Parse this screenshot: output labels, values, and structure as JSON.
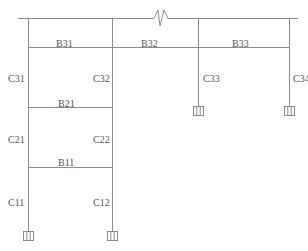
{
  "diagram": {
    "type": "structural-frame-elevation",
    "line_color": "#8c8c8c",
    "text_color": "#555555",
    "beams": [
      {
        "id": "B31",
        "label": "B31",
        "x": 56,
        "y": 39
      },
      {
        "id": "B32",
        "label": "B32",
        "x": 141,
        "y": 39
      },
      {
        "id": "B33",
        "label": "B33",
        "x": 232,
        "y": 39
      },
      {
        "id": "B21",
        "label": "B21",
        "x": 58,
        "y": 99
      },
      {
        "id": "B11",
        "label": "B11",
        "x": 58,
        "y": 158
      }
    ],
    "columns": [
      {
        "id": "C31",
        "label": "C31",
        "x": 8,
        "y": 74
      },
      {
        "id": "C32",
        "label": "C32",
        "x": 93,
        "y": 74
      },
      {
        "id": "C33",
        "label": "C33",
        "x": 203,
        "y": 74
      },
      {
        "id": "C34",
        "label": "C34",
        "x": 293,
        "y": 74
      },
      {
        "id": "C21",
        "label": "C21",
        "x": 8,
        "y": 135
      },
      {
        "id": "C22",
        "label": "C22",
        "x": 93,
        "y": 135
      },
      {
        "id": "C11",
        "label": "C11",
        "x": 8,
        "y": 198
      },
      {
        "id": "C12",
        "label": "C12",
        "x": 93,
        "y": 198
      }
    ],
    "supports": [
      {
        "id": "support-C11",
        "x": 28,
        "y": 231
      },
      {
        "id": "support-C12",
        "x": 112,
        "y": 231
      },
      {
        "id": "support-C33",
        "x": 198,
        "y": 106
      },
      {
        "id": "support-C34",
        "x": 289,
        "y": 106
      }
    ],
    "break_symbol": {
      "x": 158,
      "y": 18
    }
  }
}
